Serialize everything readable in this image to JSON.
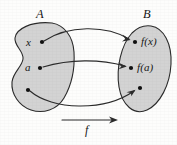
{
  "figure": {
    "kind": "function-mapping-diagram",
    "width": 177,
    "height": 145,
    "background_color": "#fdfdfc",
    "ink_color": "#2b2b2b",
    "set_fill_color": "#d3d3d3"
  },
  "sets": {
    "domain": {
      "label": "A",
      "label_x": 36,
      "label_y": 8
    },
    "codomain": {
      "label": "B",
      "label_x": 143,
      "label_y": 8
    }
  },
  "domain_points": [
    {
      "label": "x",
      "label_x": 26,
      "label_y": 37,
      "dot_x": 42,
      "dot_y": 42
    },
    {
      "label": "a",
      "label_x": 25,
      "label_y": 62,
      "dot_x": 40,
      "dot_y": 68
    },
    {
      "label": "",
      "label_x": 0,
      "label_y": 0,
      "dot_x": 28,
      "dot_y": 90
    }
  ],
  "codomain_points": [
    {
      "label": "f(x)",
      "label_x": 141,
      "label_y": 36,
      "dot_x": 135,
      "dot_y": 42
    },
    {
      "label": "f(a)",
      "label_x": 137,
      "label_y": 62,
      "dot_x": 131,
      "dot_y": 68
    },
    {
      "label": "",
      "label_x": 0,
      "label_y": 0,
      "dot_x": 140,
      "dot_y": 88
    }
  ],
  "mapping_arrows": [
    {
      "name": "x-to-fx",
      "from": "x",
      "to": "f(x)",
      "curve": "arcs-upward"
    },
    {
      "name": "a-to-fa",
      "from": "a",
      "to": "f(a)",
      "curve": "nearly-straight"
    },
    {
      "name": "lower-to-lower",
      "from": "unlabeled-domain-point",
      "to": "unlabeled-codomain-point",
      "curve": "arcs-downward"
    }
  ],
  "function_arrow": {
    "label": "f",
    "label_x": 85,
    "label_y": 124,
    "start_x": 62,
    "end_x": 118,
    "y": 120
  }
}
